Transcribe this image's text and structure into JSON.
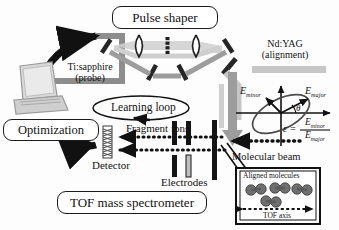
{
  "figure": {
    "type": "experimental-setup-diagram"
  },
  "boxes": {
    "pulse_shaper": "Pulse shaper",
    "optimization": "Optimization",
    "tof_spectrometer": "TOF mass spectrometer"
  },
  "labels": {
    "ndyag_line1": "Nd:YAG",
    "ndyag_line2": "(alignment)",
    "tisapph_line1": "Ti:sapphire",
    "tisapph_line2": "(probe)",
    "learning_loop": "Learning loop",
    "fragment_ions": "Fragment ions",
    "detector": "Detector",
    "electrodes": "Electrodes",
    "molecular_beam": "Molecular beam"
  },
  "polarization": {
    "e_minor_label": "E",
    "e_minor_sub": "minor",
    "e_major_label": "E",
    "e_major_sub": "major",
    "theta": "θ",
    "epsilon_symbol": "ε =",
    "numerator": "E",
    "numerator_sub": "minor",
    "denominator": "E",
    "denominator_sub": "major"
  },
  "inset": {
    "title": "Aligned molecules",
    "axis_label": "TOF axis"
  },
  "colors": {
    "ink": "#1a1a1a",
    "beam_grey": "#8d8d8d",
    "beam_light": "#c9c9c9",
    "optic_dark": "#262626",
    "paper": "#ffffff"
  }
}
